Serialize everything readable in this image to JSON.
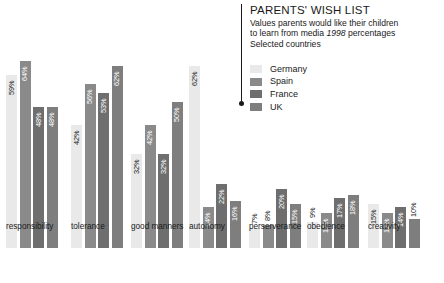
{
  "header": {
    "title": "PARENTS' WISH LIST",
    "subtitle_line1": "Values parents would like their children",
    "subtitle_line2_pre": "to learn from media",
    "subtitle_year": "1998",
    "subtitle_line2_post": "percentages",
    "subtitle_line3": "Selected countries"
  },
  "legend": {
    "items": [
      {
        "label": "Germany",
        "color": "#e9e9e9"
      },
      {
        "label": "Spain",
        "color": "#8a8a8a"
      },
      {
        "label": "France",
        "color": "#6e6e6e"
      },
      {
        "label": "UK",
        "color": "#7e7e7e"
      }
    ]
  },
  "chart_data": {
    "type": "bar",
    "title": "PARENTS' WISH LIST",
    "subtitle": "Values parents would like their children to learn from media 1998 percentages Selected countries",
    "xlabel": "",
    "ylabel": "percentages",
    "ylim": [
      0,
      70
    ],
    "grid": false,
    "legend_position": "top-right",
    "categories": [
      "responsibility",
      "tolerance",
      "good manners",
      "autonomy",
      "perserverance",
      "obedience",
      "creativity"
    ],
    "series": [
      {
        "name": "Germany",
        "color": "#e9e9e9",
        "values": [
          59,
          42,
          32,
          62,
          7,
          9,
          15
        ],
        "labels": [
          "59%",
          "42%",
          "32%",
          "62%",
          "7%",
          "9%",
          "15%"
        ]
      },
      {
        "name": "Spain",
        "color": "#8a8a8a",
        "values": [
          64,
          56,
          42,
          14,
          8,
          12,
          12
        ],
        "labels": [
          "64%",
          "56%",
          "42%",
          "14%",
          "8%",
          "12%",
          "12%"
        ]
      },
      {
        "name": "France",
        "color": "#6e6e6e",
        "values": [
          48,
          53,
          32,
          22,
          20,
          17,
          14
        ],
        "labels": [
          "48%",
          "53%",
          "32%",
          "22%",
          "20%",
          "17%",
          "14%"
        ]
      },
      {
        "name": "UK",
        "color": "#7e7e7e",
        "values": [
          48,
          62,
          50,
          16,
          15,
          18,
          10
        ],
        "labels": [
          "48%",
          "62%",
          "50%",
          "16%",
          "15%",
          "18%",
          "10%"
        ]
      }
    ]
  }
}
